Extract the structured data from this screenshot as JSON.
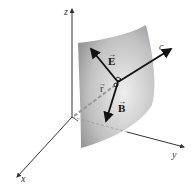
{
  "diagram": {
    "axes": {
      "x": {
        "label": "x"
      },
      "y": {
        "label": "y"
      },
      "z": {
        "label": "z"
      }
    },
    "vectors": {
      "E": {
        "label": "E",
        "arrow": "→"
      },
      "B": {
        "label": "B",
        "arrow": "→"
      },
      "r": {
        "label": "r",
        "arrow": "→"
      },
      "c": {
        "label": "c"
      }
    },
    "colors": {
      "surface_light": "#e8e8e8",
      "surface_dark": "#8f8f8f",
      "vector": "#111111",
      "axis": "#333333",
      "dashed": "#9a9a9a"
    }
  }
}
